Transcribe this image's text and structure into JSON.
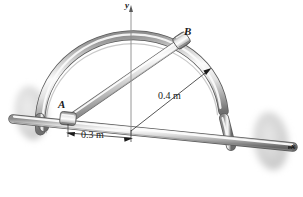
{
  "figure": {
    "background_color": "#ffffff",
    "labels": {
      "point_a": "A",
      "point_b": "B",
      "axis_y": "y",
      "axis_x": "x",
      "radius_dimension": "0.4 m",
      "span_dimension": "0.3 m"
    },
    "colors": {
      "ink": "#1a1a1a",
      "metal_light": "#f2f2f2",
      "metal_mid": "#b8b8b8",
      "metal_dark": "#6e6e6e",
      "metal_shadow": "#4a4a4a",
      "bearing_disc": "#d9d9d9",
      "dimension_line": "#2b2b2b"
    },
    "geometry": {
      "ring_radius_m": 0.4,
      "point_a_offset_m": 0.3,
      "origin_px": [
        131,
        131
      ],
      "ring_center_px": [
        131,
        131
      ],
      "point_a_px": [
        68,
        118
      ],
      "point_b_px": [
        183,
        41
      ],
      "shaft_left_px": [
        14,
        119
      ],
      "shaft_right_px": [
        292,
        147
      ],
      "left_bearing_px": [
        30,
        113
      ],
      "right_bearing_px": [
        268,
        140
      ]
    }
  }
}
